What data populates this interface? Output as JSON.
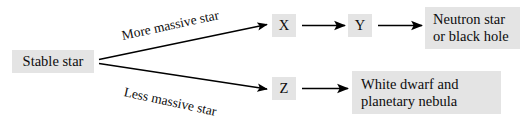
{
  "diagram": {
    "background_color": "#ffffff",
    "node_fill_color": "#e4e4e4",
    "text_color": "#0d0d0d",
    "stroke_color": "#000000",
    "nodes": {
      "stable_star": {
        "label": "Stable star"
      },
      "x": {
        "label": "X"
      },
      "y": {
        "label": "Y"
      },
      "z": {
        "label": "Z"
      },
      "neutron": {
        "line1": "Neutron star",
        "line2": "or black hole"
      },
      "white_dwarf": {
        "line1": "White dwarf and",
        "line2": "planetary nebula"
      }
    },
    "edges": {
      "more_massive": {
        "label": "More massive star"
      },
      "less_massive": {
        "label": "Less massive star"
      },
      "x_to_y": {
        "label": ""
      },
      "y_to_neutron": {
        "label": ""
      },
      "z_to_white_dwarf": {
        "label": ""
      }
    }
  }
}
